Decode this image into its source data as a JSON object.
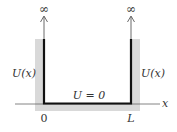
{
  "diagram": {
    "labels": {
      "left_infinity": "∞",
      "right_infinity": "∞",
      "left_potential": "U(x)",
      "right_potential": "U(x)",
      "inside_potential": "U = 0",
      "x_axis": "x",
      "origin_tick": "0",
      "right_tick": "L"
    },
    "colors": {
      "wall_shade": "#d9d9d9",
      "well_line": "#111111",
      "axis": "#555555",
      "text": "#333333"
    }
  }
}
